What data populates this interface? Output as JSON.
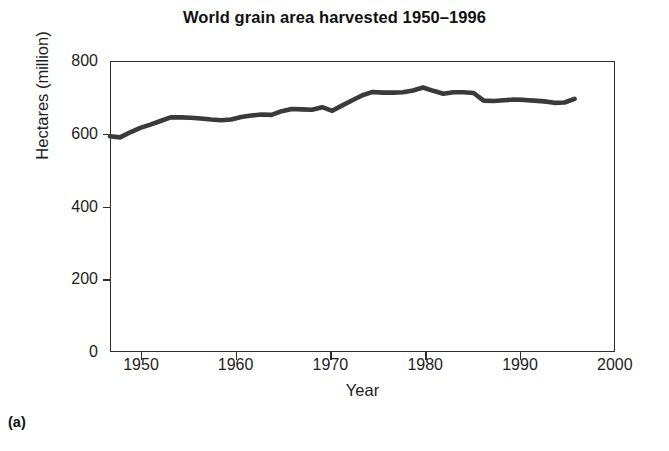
{
  "figure": {
    "panel_label": "(a)",
    "title": "World grain area harvested 1950–1996",
    "line_color": "#3a3a3a",
    "frame_color": "#2e2e2e"
  },
  "chart_data": {
    "type": "line",
    "title": "World grain area harvested 1950–1996",
    "xlabel": "Year",
    "ylabel": "Hectares (million)",
    "xlim": [
      1950,
      2000
    ],
    "ylim": [
      0,
      800
    ],
    "xticks": [
      1950,
      1960,
      1970,
      1980,
      1990,
      2000
    ],
    "yticks": [
      0,
      200,
      400,
      600,
      800
    ],
    "xtick_labels": [
      "1950",
      "1960",
      "1970",
      "1980",
      "1990",
      "2000"
    ],
    "ytick_labels": [
      "0",
      "200",
      "400",
      "600",
      "800"
    ],
    "grid": false,
    "legend": false,
    "series": [
      {
        "name": "World grain area harvested",
        "units": "million hectares",
        "x": [
          1950,
          1951,
          1952,
          1953,
          1954,
          1955,
          1956,
          1957,
          1958,
          1959,
          1960,
          1961,
          1962,
          1963,
          1964,
          1965,
          1966,
          1967,
          1968,
          1969,
          1970,
          1971,
          1972,
          1973,
          1974,
          1975,
          1976,
          1977,
          1978,
          1979,
          1980,
          1981,
          1982,
          1983,
          1984,
          1985,
          1986,
          1987,
          1988,
          1989,
          1990,
          1991,
          1992,
          1993,
          1994,
          1995,
          1996
        ],
        "values": [
          593,
          590,
          604,
          616,
          625,
          635,
          645,
          645,
          644,
          642,
          639,
          637,
          639,
          646,
          650,
          653,
          652,
          662,
          668,
          667,
          666,
          673,
          663,
          678,
          692,
          706,
          715,
          713,
          713,
          714,
          719,
          727,
          718,
          710,
          714,
          714,
          712,
          691,
          690,
          692,
          694,
          693,
          691,
          689,
          685,
          686,
          696
        ]
      }
    ]
  },
  "axis": {
    "y_title": "Hectares (million)",
    "x_title": "Year"
  }
}
